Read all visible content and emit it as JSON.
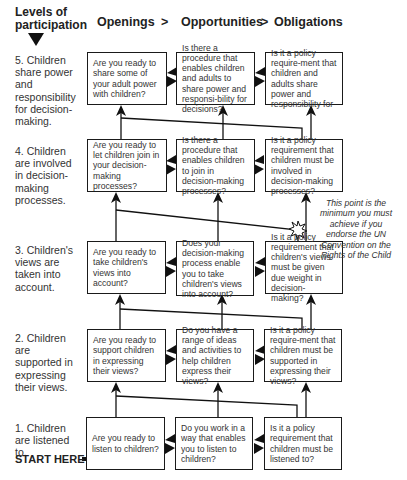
{
  "header": {
    "levels_title_line1": "Levels of",
    "levels_title_line2": "participation",
    "columns": [
      "Openings",
      "Opportunities",
      "Obligations"
    ],
    "separator": ">"
  },
  "levels": [
    {
      "number": 5,
      "label": "5. Children share power and responsibility for decision-making.",
      "boxes": [
        "Are you ready to share some of your adult power with children?",
        "Is there a procedure that enables children and adults to share power and responsi-bility for decisions?",
        "Is it a policy require-ment that children and adults share power and responsibility for"
      ]
    },
    {
      "number": 4,
      "label": "4. Children are involved in decision-making processes.",
      "boxes": [
        "Are you ready to let children join in your decision-making processes?",
        "Is there a procedure that enables children to join in decision-making processes?",
        "Is it a policy requirement that children must be involved in decision-making processes?"
      ]
    },
    {
      "number": 3,
      "label": "3. Children's views are taken into account.",
      "boxes": [
        "Are you ready to take children's views into account?",
        "Does your decision-making process enable you to take children's views into account?",
        "Is it a policy requirement that children's views must be given due weight in decision-making?"
      ]
    },
    {
      "number": 2,
      "label": "2. Children are supported in expressing their views.",
      "boxes": [
        "Are you ready to support children in expressing their views?",
        "Do you have a range of ideas and activities to help children express their views?",
        "Is it a policy require-ment that children must be supported in expressing their views?"
      ]
    },
    {
      "number": 1,
      "label": "1. Children are listened to.",
      "boxes": [
        "Are you ready to listen to children?",
        "Do you work in a way that enables you to listen to children?",
        "Is it a policy requirement that children must be listened to?"
      ]
    }
  ],
  "note": "This point is the minimum you must achieve if you endorse the UN Convention on the Rights of the Child",
  "start_label": "START HERE",
  "icons": {
    "levels_arrow": "down-triangle-icon",
    "start_arrow": "right-arrow-icon",
    "minimum_point": "star-burst-icon",
    "box_connector": "bidirectional-arrow-icon",
    "level_up": "up-arrow-icon"
  },
  "colors": {
    "stroke": "#1a1a1a",
    "text": "#333333",
    "background": "#ffffff"
  }
}
